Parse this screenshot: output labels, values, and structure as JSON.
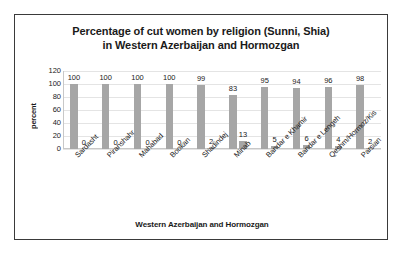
{
  "chart_data": {
    "type": "bar",
    "title": "Percentage of cut women by religion (Sunni, Shia) in Western Azerbaijan and Hormozgan",
    "title_lines": [
      "Percentage of cut women by religion (Sunni, Shia)",
      "in Western Azerbaijan and Hormozgan"
    ],
    "xlabel": "Western Azerbaijan and Hormozgan",
    "ylabel": "percent",
    "ylim": [
      0,
      120
    ],
    "yticks": [
      120,
      100,
      80,
      60,
      40,
      20,
      0
    ],
    "grid": true,
    "legend": "none",
    "bar_color": "#a6a6a6",
    "categories": [
      "Sardasht",
      "Piranshahr",
      "Mahabad",
      "Bookan",
      "Shadindej",
      "Minab",
      "Bandar e Khamir",
      "Bandar e Lengeh",
      "Qeshm/Hormoz/Kis",
      "Parsian"
    ],
    "series": [
      {
        "name": "Sunni",
        "values": [
          100,
          100,
          100,
          100,
          99,
          83,
          95,
          94,
          96,
          98
        ]
      },
      {
        "name": "Shia",
        "values": [
          0,
          0,
          0,
          0,
          2,
          13,
          5,
          6,
          4,
          2
        ]
      }
    ]
  }
}
